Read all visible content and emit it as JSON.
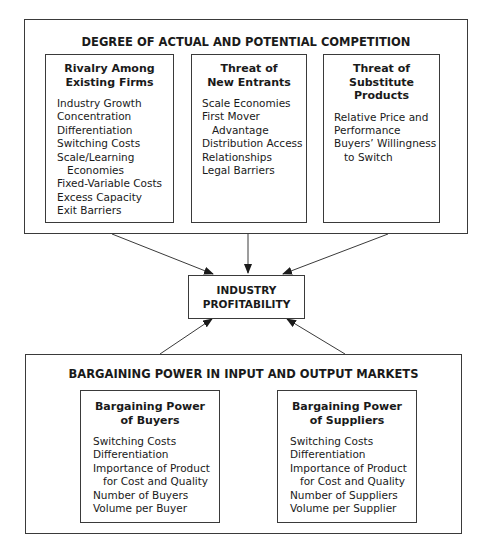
{
  "competition": {
    "title": "DEGREE OF ACTUAL AND POTENTIAL COMPETITION",
    "boxes": [
      {
        "title_line1": "Rivalry Among",
        "title_line2": "Existing Firms",
        "items": [
          "Industry Growth",
          "Concentration",
          "Differentiation",
          "Switching Costs",
          "Scale/Learning",
          "Economies",
          "Fixed-Variable Costs",
          "Excess Capacity",
          "Exit Barriers"
        ]
      },
      {
        "title_line1": "Threat of",
        "title_line2": "New Entrants",
        "items": [
          "Scale Economies",
          "First Mover",
          "Advantage",
          "Distribution Access",
          "Relationships",
          "Legal Barriers"
        ]
      },
      {
        "title_line1": "Threat of",
        "title_line2": "Substitute Products",
        "items": [
          "Relative Price and",
          "Performance",
          "Buyers’ Willingness",
          "to Switch"
        ]
      }
    ]
  },
  "center": {
    "line1": "INDUSTRY",
    "line2": "PROFITABILITY"
  },
  "bargaining": {
    "title": "BARGAINING POWER IN INPUT AND OUTPUT MARKETS",
    "boxes": [
      {
        "title_line1": "Bargaining Power",
        "title_line2": "of Buyers",
        "items": [
          "Switching Costs",
          "Differentiation",
          "Importance of Product",
          "for Cost and Quality",
          "Number of Buyers",
          "Volume per Buyer"
        ]
      },
      {
        "title_line1": "Bargaining Power",
        "title_line2": "of Suppliers",
        "items": [
          "Switching Costs",
          "Differentiation",
          "Importance of Product",
          "for Cost and Quality",
          "Number of Suppliers",
          "Volume per Supplier"
        ]
      }
    ]
  },
  "colors": {
    "line": "#3a3a3a",
    "text": "#1a1a1a",
    "background": "#ffffff"
  }
}
